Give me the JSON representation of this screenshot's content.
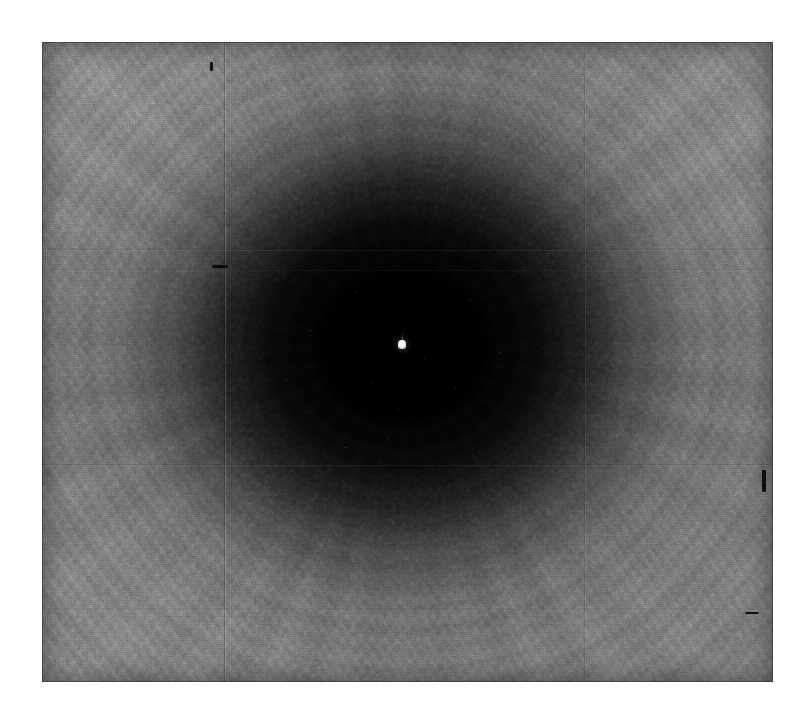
{
  "image": {
    "domain": "Natural-Image",
    "subject": "dark-vortex-artwork",
    "description": "Photograph of a large charcoal and graphite drawing: a deep circular void or whirlpool rendered in sweeping radial strokes, pitch black at its centre, lightening to mid-grey at the edges of the panel.",
    "medium": "charcoal on panelled support",
    "orientation": "landscape",
    "background_margin_color": "#ffffff",
    "plate": {
      "left": 42,
      "top": 42,
      "width": 731,
      "height": 640,
      "edge_tone": "#626262"
    },
    "palette": {
      "void_core": "#000000",
      "inner_shadow": "#0d0d0d",
      "mid_tone": "#393939",
      "outer_tone": "#5d5d5d",
      "highlight_tone": "#6e6e6e",
      "bright_point": "#ffffff",
      "margin": "#ffffff"
    },
    "focal_point": {
      "label": "tiny luminous figure at the centre of the void",
      "x": 402,
      "y": 345,
      "width": 8,
      "height": 9,
      "color": "#ffffff"
    },
    "vortex": {
      "center_x_pct": 49.5,
      "center_y_pct": 47.3,
      "core_radius_pct": 22,
      "falloff": "radial, steep between 30% and 60% of the radius",
      "stroke_direction": "counter-clockwise spiral sweeps"
    },
    "seams": {
      "vertical": [
        225,
        585
      ],
      "horizontal": [
        250,
        270,
        465,
        610
      ]
    },
    "marks": [
      {
        "name": "nick-upper-left",
        "x": 212,
        "y": 265,
        "width": 16,
        "height": 3
      },
      {
        "name": "nick-upper-center",
        "x": 210,
        "y": 62,
        "width": 3,
        "height": 9
      },
      {
        "name": "nick-right-edge",
        "x": 762,
        "y": 470,
        "width": 4,
        "height": 22
      },
      {
        "name": "nick-lower-right",
        "x": 745,
        "y": 612,
        "width": 14,
        "height": 2
      }
    ],
    "specks": [
      {
        "x": 330,
        "y": 262
      },
      {
        "x": 356,
        "y": 291
      },
      {
        "x": 372,
        "y": 382
      },
      {
        "x": 424,
        "y": 358
      },
      {
        "x": 455,
        "y": 388
      },
      {
        "x": 398,
        "y": 409
      },
      {
        "x": 310,
        "y": 330
      },
      {
        "x": 470,
        "y": 300
      },
      {
        "x": 388,
        "y": 438
      },
      {
        "x": 345,
        "y": 447
      },
      {
        "x": 500,
        "y": 352
      },
      {
        "x": 286,
        "y": 380
      }
    ]
  }
}
